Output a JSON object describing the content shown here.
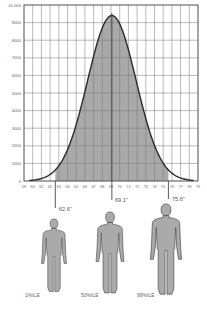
{
  "chart_data": {
    "type": "area",
    "title": "",
    "xlabel": "",
    "ylabel": "",
    "x_ticks": [
      "59",
      "60",
      "61",
      "62",
      "63",
      "64",
      "65",
      "66",
      "67",
      "68",
      "69",
      "70",
      "71",
      "72",
      "73",
      "74",
      "75",
      "76",
      "77",
      "78",
      "79"
    ],
    "y_ticks": [
      "0",
      "1000",
      "2000",
      "3000",
      "4000",
      "5000",
      "6000",
      "7000",
      "8000",
      "9000",
      "10,000"
    ],
    "xlim": [
      59,
      79
    ],
    "ylim": [
      0,
      10000
    ],
    "grid": true,
    "series": [
      {
        "name": "Stature distribution (normal curve)",
        "mean": 69.1,
        "peak": 9400,
        "x": [
          59.5,
          61,
          62,
          62.6,
          63,
          64,
          65,
          66,
          67,
          68,
          69.1,
          70,
          71,
          72,
          73,
          74,
          75,
          75.6,
          76,
          77,
          78.5
        ],
        "values": [
          150,
          400,
          800,
          1100,
          1350,
          2200,
          3300,
          4700,
          6300,
          7900,
          9400,
          9000,
          7900,
          6300,
          4700,
          3300,
          2200,
          1650,
          1350,
          800,
          320
        ]
      }
    ],
    "shaded_region": {
      "from": 62.6,
      "to": 75.6,
      "label": "1st to 99th percentile"
    },
    "markers": [
      {
        "percentile": "1%ILE",
        "value": "62.6\"",
        "x": 62.6
      },
      {
        "percentile": "50%ILE",
        "value": "69.1\"",
        "x": 69.1
      },
      {
        "percentile": "99%ILE",
        "value": "75.6\"",
        "x": 75.6
      }
    ]
  },
  "figures": [
    {
      "label": "1%ILE",
      "height_label": "62.6\""
    },
    {
      "label": "50%ILE",
      "height_label": "69.1\""
    },
    {
      "label": "99%ILE",
      "height_label": "75.6\""
    }
  ]
}
